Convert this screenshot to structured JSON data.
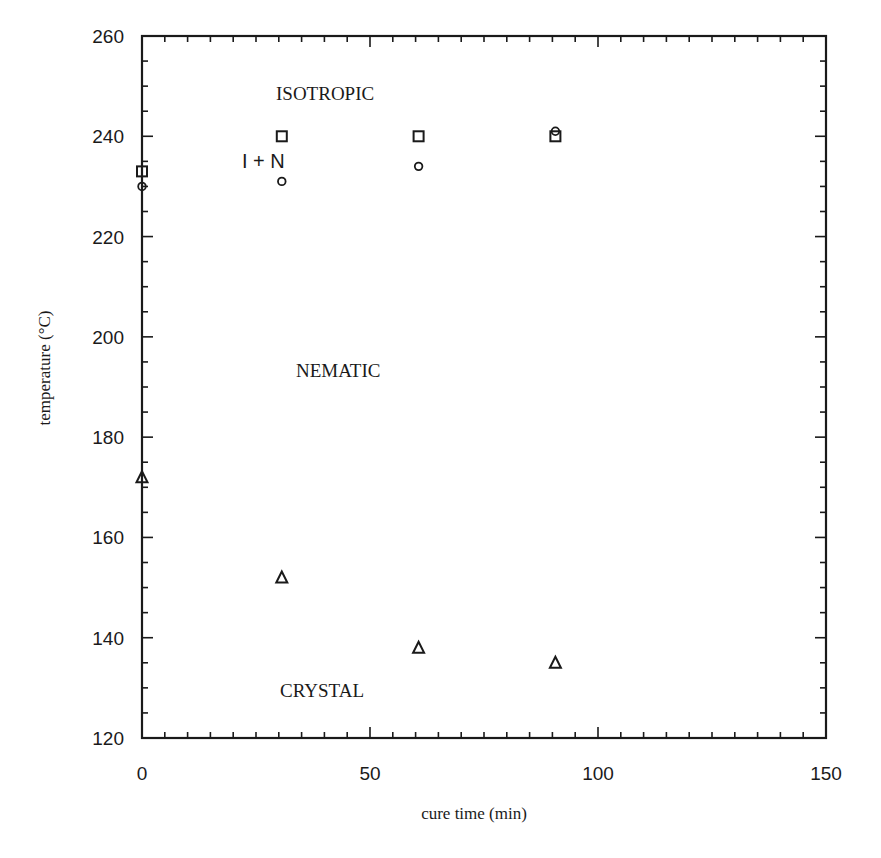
{
  "chart_data": {
    "type": "scatter",
    "title": "",
    "xlabel": "cure time (min)",
    "ylabel": "temperature (°C)",
    "xlim": [
      0,
      150
    ],
    "ylim": [
      120,
      260
    ],
    "x_ticks": [
      0,
      50,
      100,
      150
    ],
    "y_ticks": [
      120,
      140,
      160,
      180,
      200,
      220,
      240,
      260
    ],
    "x_minor_step": 5,
    "y_minor_step": 5,
    "grid": false,
    "legend": null,
    "series": [
      {
        "name": "isotropization (square)",
        "marker": "square",
        "x": [
          0,
          30,
          60,
          90
        ],
        "y": [
          233,
          240,
          240,
          240
        ]
      },
      {
        "name": "nematic onset (circle)",
        "marker": "circle",
        "x": [
          0,
          30,
          60,
          90
        ],
        "y": [
          230,
          231,
          234,
          241
        ]
      },
      {
        "name": "crystal melting (triangle)",
        "marker": "triangle",
        "x": [
          0,
          30,
          60,
          90
        ],
        "y": [
          172,
          152,
          138,
          135
        ]
      }
    ],
    "annotations": [
      {
        "text": "ISOTROPIC",
        "x": 30,
        "y": 248
      },
      {
        "text": "I + N",
        "x": 24,
        "y": 235
      },
      {
        "text": "NEMATIC",
        "x": 34,
        "y": 194
      },
      {
        "text": "CRYSTAL",
        "x": 32,
        "y": 129
      }
    ]
  },
  "labels": {
    "x_axis_title": "cure time (min)",
    "y_axis_title": "temperature (°C)",
    "region_isotropic": "ISOTROPIC",
    "region_i_plus_n": "I + N",
    "region_nematic": "NEMATIC",
    "region_crystal": "CRYSTAL"
  }
}
